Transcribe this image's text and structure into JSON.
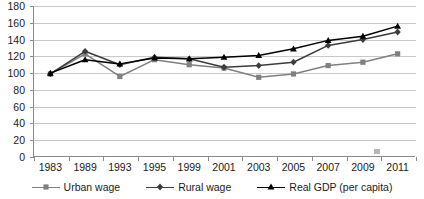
{
  "chart_data": {
    "type": "line",
    "title": "",
    "xlabel": "",
    "ylabel": "",
    "categories": [
      "1983",
      "1989",
      "1993",
      "1995",
      "1999",
      "2001",
      "2003",
      "2005",
      "2007",
      "2009",
      "2011"
    ],
    "ylim": [
      0,
      180
    ],
    "ytick_step": 20,
    "yticks": [
      180,
      160,
      140,
      120,
      100,
      80,
      60,
      40,
      20,
      0
    ],
    "grid": "horizontal",
    "legend_position": "bottom",
    "series": [
      {
        "name": "Urban wage",
        "marker": "square",
        "color": "#808080",
        "values": [
          99,
          123,
          96,
          116,
          110,
          106,
          95,
          99,
          109,
          113,
          123
        ]
      },
      {
        "name": "Rural wage",
        "marker": "diamond",
        "color": "#3c3c3c",
        "values": [
          99,
          126,
          110,
          119,
          117,
          107,
          109,
          113,
          133,
          140,
          149
        ]
      },
      {
        "name": "Real GDP (per capita)",
        "marker": "triangle",
        "color": "#000000",
        "values": [
          100,
          116,
          111,
          118,
          117,
          119,
          121,
          129,
          139,
          144,
          156
        ]
      }
    ]
  },
  "axis": {
    "y_labels": [
      "180",
      "160",
      "140",
      "120",
      "100",
      "80",
      "60",
      "40",
      "20",
      "0"
    ],
    "x_labels": [
      "1983",
      "1989",
      "1993",
      "1995",
      "1999",
      "2001",
      "2003",
      "2005",
      "2007",
      "2009",
      "2011"
    ]
  },
  "legend": {
    "items": [
      {
        "label": "Urban wage"
      },
      {
        "label": "Rural wage"
      },
      {
        "label": "Real GDP (per capita)"
      }
    ]
  },
  "colors": {
    "urban": "#808080",
    "rural": "#3c3c3c",
    "gdp": "#000000",
    "grid": "#c9c9c9",
    "axis": "#8a8a8a"
  }
}
